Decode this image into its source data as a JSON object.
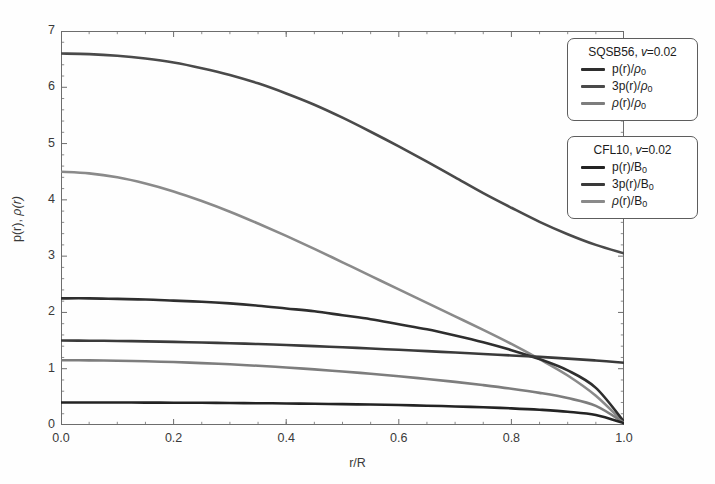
{
  "chart_data": {
    "type": "line",
    "title": "",
    "xlabel": "r/R",
    "ylabel": "p(r), ρ(r)",
    "xlim": [
      0.0,
      1.0
    ],
    "ylim": [
      0,
      7
    ],
    "xticks": [
      "0.0",
      "0.2",
      "0.4",
      "0.6",
      "0.8",
      "1.0"
    ],
    "xtick_values": [
      0.0,
      0.2,
      0.4,
      0.6,
      0.8,
      1.0
    ],
    "yticks": [
      "0",
      "1",
      "2",
      "3",
      "4",
      "5",
      "6",
      "7"
    ],
    "ytick_values": [
      0,
      1,
      2,
      3,
      4,
      5,
      6,
      7
    ],
    "grid": false,
    "minor_ticks": true,
    "legend_position": "upper-right-outside",
    "x": [
      0.0,
      0.05,
      0.1,
      0.15,
      0.2,
      0.25,
      0.3,
      0.35,
      0.4,
      0.45,
      0.5,
      0.55,
      0.6,
      0.65,
      0.7,
      0.75,
      0.8,
      0.85,
      0.9,
      0.95,
      1.0
    ],
    "series": [
      {
        "name": "ρ(r)/ρ₀",
        "group": "SQSB56",
        "color": "#4a4a4a",
        "width": 2.6,
        "values": [
          6.6,
          6.59,
          6.56,
          6.51,
          6.44,
          6.34,
          6.22,
          6.07,
          5.89,
          5.69,
          5.46,
          5.21,
          4.95,
          4.68,
          4.4,
          4.12,
          3.86,
          3.61,
          3.39,
          3.2,
          3.05
        ]
      },
      {
        "name": "ρ(r)/B₀",
        "group": "CFL10",
        "color": "#8a8a8a",
        "width": 2.6,
        "values": [
          4.5,
          4.47,
          4.4,
          4.29,
          4.15,
          3.98,
          3.79,
          3.58,
          3.36,
          3.13,
          2.89,
          2.65,
          2.41,
          2.17,
          1.93,
          1.69,
          1.44,
          1.17,
          0.88,
          0.52,
          0.04
        ]
      },
      {
        "name": "p(r)/ρ₀",
        "group": "SQSB56",
        "color": "#2e2e2e",
        "width": 2.6,
        "values": [
          2.25,
          2.25,
          2.24,
          2.23,
          2.21,
          2.19,
          2.16,
          2.12,
          2.07,
          2.02,
          1.95,
          1.88,
          1.79,
          1.7,
          1.59,
          1.47,
          1.33,
          1.17,
          0.97,
          0.66,
          0.06
        ]
      },
      {
        "name": "3p(r)/B₀",
        "group": "CFL10",
        "color": "#3a3a3a",
        "width": 2.6,
        "values": [
          1.5,
          1.498,
          1.493,
          1.486,
          1.477,
          1.466,
          1.453,
          1.438,
          1.421,
          1.402,
          1.381,
          1.359,
          1.336,
          1.312,
          1.287,
          1.262,
          1.236,
          1.21,
          1.18,
          1.147,
          1.105
        ]
      },
      {
        "name": "3p(r)/ρ₀",
        "group": "SQSB56",
        "color": "#7d7d7d",
        "width": 2.6,
        "values": [
          1.15,
          1.148,
          1.142,
          1.132,
          1.118,
          1.1,
          1.078,
          1.052,
          1.022,
          0.988,
          0.951,
          0.91,
          0.866,
          0.818,
          0.766,
          0.709,
          0.645,
          0.571,
          0.478,
          0.34,
          0.04
        ]
      },
      {
        "name": "p(r)/B₀",
        "group": "CFL10",
        "color": "#232323",
        "width": 2.6,
        "values": [
          0.4,
          0.4,
          0.399,
          0.398,
          0.396,
          0.394,
          0.391,
          0.387,
          0.383,
          0.377,
          0.371,
          0.363,
          0.354,
          0.343,
          0.33,
          0.315,
          0.296,
          0.271,
          0.236,
          0.177,
          0.03
        ]
      }
    ],
    "annotations": []
  },
  "axes": {
    "ylabel_p": "p(r)",
    "ylabel_sep": ", ",
    "ylabel_rho": "ρ(r)",
    "xlabel": "r/R",
    "ytick_labels": [
      "7",
      "6",
      "5",
      "4",
      "3",
      "2",
      "1",
      "0"
    ],
    "xtick_labels": [
      "0.0",
      "0.2",
      "0.4",
      "0.6",
      "0.8",
      "1.0"
    ]
  },
  "legends": [
    {
      "id": "sqsb56",
      "model": "SQSB56",
      "param_symbol": "v",
      "param_value": "=0.02",
      "entries": [
        {
          "label_main": "p(r)/",
          "label_rho": "ρ",
          "label_sub": "0",
          "color": "#2e2e2e"
        },
        {
          "label_main": "3p(r)/",
          "label_rho": "ρ",
          "label_sub": "0",
          "color": "#4a4a4a"
        },
        {
          "label_main": "",
          "label_rho_lead": "ρ",
          "label_main2": "(r)/",
          "label_rho": "ρ",
          "label_sub": "0",
          "color": "#7d7d7d"
        }
      ]
    },
    {
      "id": "cfl10",
      "model": "CFL10",
      "param_symbol": "v",
      "param_value": "=0.02",
      "entries": [
        {
          "label_main": "p(r)/B",
          "label_sub": "0",
          "color": "#232323"
        },
        {
          "label_main": "3p(r)/B",
          "label_sub": "0",
          "color": "#3a3a3a"
        },
        {
          "label_main": "(r)/B",
          "label_rho_lead": "ρ",
          "label_sub": "0",
          "color": "#8a8a8a"
        }
      ]
    }
  ]
}
